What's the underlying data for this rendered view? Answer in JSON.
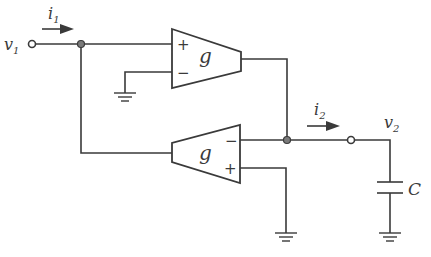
{
  "diagram": {
    "type": "circuit",
    "colors": {
      "line": "#3a3a3a",
      "node_fill": "#7a7a7a",
      "background": "#ffffff"
    },
    "labels": {
      "v1": "v",
      "v1_sub": "1",
      "i1": "i",
      "i1_sub": "1",
      "i2": "i",
      "i2_sub": "2",
      "v2": "v",
      "v2_sub": "2",
      "capacitor": "C"
    },
    "amplifiers": [
      {
        "id": "top",
        "gain_label": "g",
        "plus_label": "+",
        "minus_label": "−",
        "orientation": "right"
      },
      {
        "id": "bottom",
        "gain_label": "g",
        "plus_label": "+",
        "minus_label": "−",
        "orientation": "left"
      }
    ],
    "components": [
      "v1 terminal",
      "transconductance amplifier (top)",
      "transconductance amplifier (bottom)",
      "v2 terminal",
      "capacitor C",
      "ground x3"
    ]
  }
}
